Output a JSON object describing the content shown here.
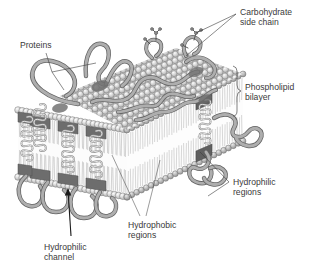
{
  "figure": {
    "background": "#ffffff"
  },
  "labels": {
    "carbohydrate": {
      "line1": "Carbohydrate",
      "line2": "side chain"
    },
    "proteins": {
      "line1": "Proteins"
    },
    "phospholipid": {
      "line1": "Phospholipid",
      "line2": "bilayer"
    },
    "hydrophilic_regions": {
      "line1": "Hydrophilic",
      "line2": "regions"
    },
    "hydrophobic_regions": {
      "line1": "Hydrophobic",
      "line2": "regions"
    },
    "hydrophilic_channel": {
      "line1": "Hydrophilic",
      "line2": "channel"
    }
  },
  "colors": {
    "text": "#3a3a3a",
    "leader": "#3c3c3c",
    "head_fill": "#d2d2d2",
    "head_stroke": "#6e6e6e",
    "head_highlight": "#f2f2f2",
    "tail": "#9a9a9a",
    "protein_fill": "#a8a8a8",
    "protein_stroke": "#5a5a5a",
    "protein_dark": "#6b6b6b",
    "helix": "#bdbdbd",
    "top_face": "#c8c8c8",
    "side_face": "#e8e8e8",
    "interior": "#fbfbfb"
  },
  "structure": {
    "membrane_faces": [
      "top-surface",
      "front-cross-section",
      "right-cross-section"
    ],
    "top_surface_rows": 9,
    "top_surface_cols": 22,
    "front_heads_count": 26,
    "transmembrane_proteins": 5,
    "carbohydrate_chains": 2,
    "surface_protein_ribbons": 6
  }
}
